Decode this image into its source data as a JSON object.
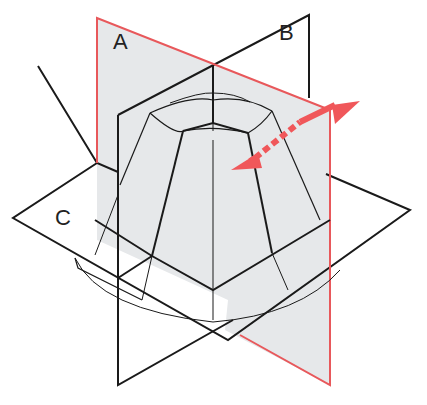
{
  "diagram": {
    "type": "3d-planes-section",
    "labels": {
      "plane_a": "A",
      "plane_b": "B",
      "plane_c": "C"
    },
    "planes": [
      {
        "id": "A",
        "orientation": "vertical",
        "edge_color": "#e8585b",
        "fill": "#e6e8ea"
      },
      {
        "id": "B",
        "orientation": "vertical",
        "edge_color": "#1a1a1a",
        "fill": "#ffffff"
      },
      {
        "id": "C",
        "orientation": "horizontal",
        "edge_color": "#1a1a1a",
        "fill": "#ffffff"
      }
    ],
    "arrow": {
      "type": "double-headed",
      "style": "solid-with-dashed-center",
      "color": "#f0575a",
      "meaning": "movement perpendicular to plane A"
    },
    "object": "faceted dome / truncated pyramid shell"
  },
  "colors": {
    "red": "#f0575a",
    "red_edge": "#e8585b",
    "plane_fill": "#e6e8ea",
    "line": "#1a1a1a"
  }
}
